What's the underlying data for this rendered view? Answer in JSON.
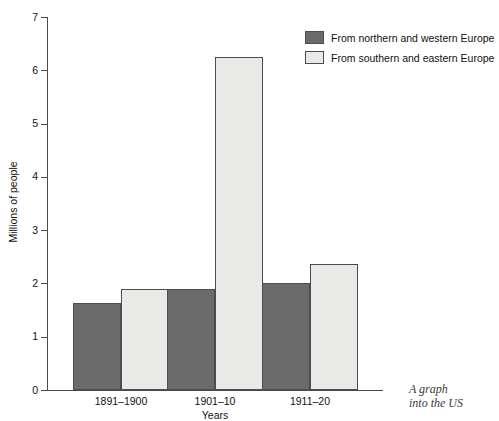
{
  "chart_data": {
    "type": "bar",
    "title": "",
    "xlabel": "Years",
    "ylabel": "Millions of people",
    "categories": [
      "1891–1900",
      "1901–10",
      "1911–20"
    ],
    "series": [
      {
        "name": "From northern and western Europe",
        "color": "#6b6b6b",
        "values": [
          1.63,
          1.9,
          2.0
        ]
      },
      {
        "name": "From southern and eastern Europe",
        "color": "#e9e9e7",
        "values": [
          1.9,
          6.25,
          2.37
        ]
      }
    ],
    "ylim": [
      0,
      7
    ],
    "yticks": [
      0,
      1,
      2,
      3,
      4,
      5,
      6,
      7
    ],
    "ytick_labels": [
      "0",
      "1",
      "2",
      "3",
      "4",
      "5",
      "6",
      "7"
    ],
    "grid": false,
    "legend_position": "top-right"
  },
  "legend": {
    "items": [
      {
        "label": "From northern and western Europe",
        "swatch": "north"
      },
      {
        "label": "From southern and eastern Europe",
        "swatch": "south"
      }
    ]
  },
  "caption": {
    "line1": "A graph",
    "line2": "into the US"
  }
}
